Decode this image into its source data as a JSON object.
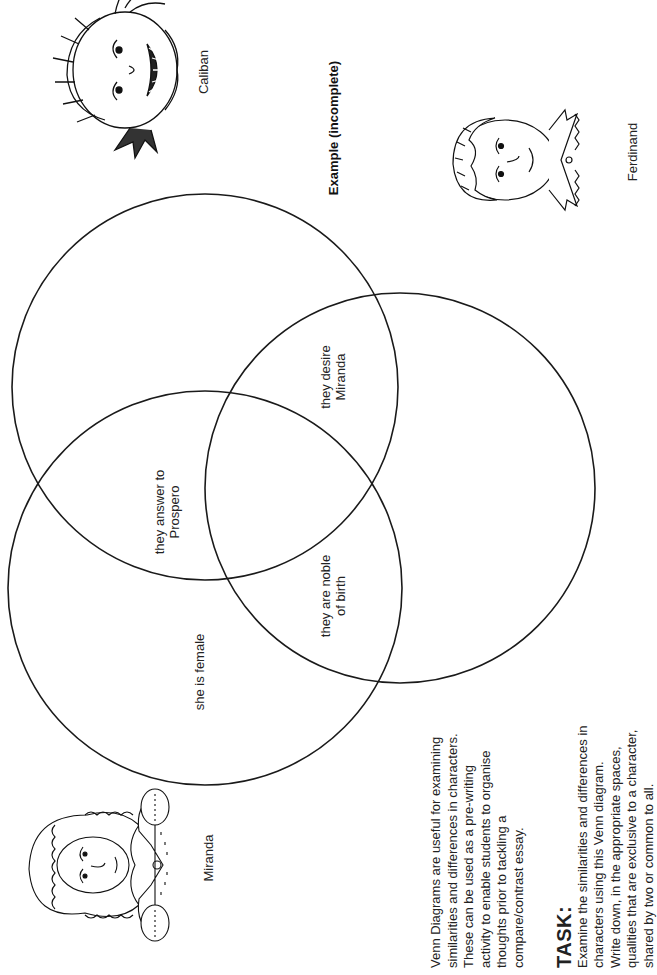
{
  "page": {
    "orientation": "landscape-rotated-ccw",
    "example_title": "Example (incomplete)"
  },
  "characters": {
    "caliban": {
      "name": "Caliban",
      "portrait": "caliban-portrait"
    },
    "ferdinand": {
      "name": "Ferdinand",
      "portrait": "ferdinand-portrait"
    },
    "miranda": {
      "name": "Miranda",
      "portrait": "miranda-portrait"
    }
  },
  "venn": {
    "circles": [
      {
        "id": "caliban",
        "label": "Caliban",
        "cx": 205,
        "cy": 387,
        "r": 193
      },
      {
        "id": "miranda",
        "label": "Miranda",
        "cx": 205,
        "cy": 588,
        "r": 197
      },
      {
        "id": "ferdinand",
        "label": "Ferdinand",
        "cx": 400,
        "cy": 488,
        "r": 195
      }
    ],
    "stroke_color": "#1a1a1a",
    "regions": {
      "caliban_miranda": {
        "line1": "they answer to",
        "line2": "Prospero"
      },
      "caliban_ferdinand": {
        "line1": "they desire",
        "line2": "Miranda"
      },
      "miranda_ferdinand": {
        "line1": "they are noble",
        "line2": "of birth"
      },
      "miranda_only": {
        "line1": "she is female"
      }
    }
  },
  "intro": {
    "lines": [
      "Venn Diagrams are useful for examining",
      "similarities and differences in characters.",
      "These can be used as a pre-writing",
      "activity to enable students to organise",
      "thoughts prior to tackling a",
      "compare/contrast essay."
    ]
  },
  "task": {
    "heading": "TASK:",
    "lines": [
      "Examine the similarities and differences in",
      "characters using this Venn diagram.",
      "Write down, in the appropriate spaces,",
      "qualities that are exclusive to a character,",
      "shared by two or common to all."
    ]
  }
}
